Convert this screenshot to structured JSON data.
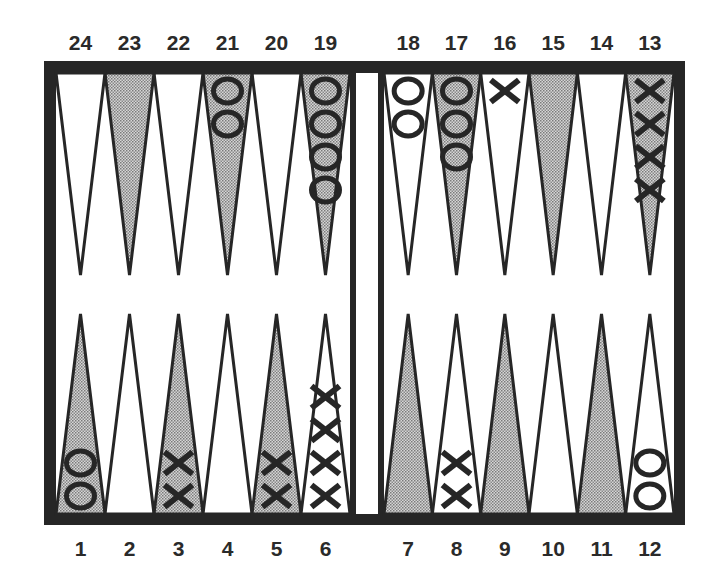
{
  "board": {
    "frame_color": "#262626",
    "shaded_fill": "#b8b8b8",
    "light_fill": "#ffffff",
    "background": "#ffffff"
  },
  "labels": {
    "top": [
      "24",
      "23",
      "22",
      "21",
      "20",
      "19",
      "18",
      "17",
      "16",
      "15",
      "14",
      "13"
    ],
    "bottom": [
      "1",
      "2",
      "3",
      "4",
      "5",
      "6",
      "7",
      "8",
      "9",
      "10",
      "11",
      "12"
    ]
  },
  "points": [
    {
      "number": 1,
      "shaded": true,
      "checkers": {
        "type": "O",
        "count": 2
      }
    },
    {
      "number": 2,
      "shaded": false,
      "checkers": {
        "type": "",
        "count": 0
      }
    },
    {
      "number": 3,
      "shaded": true,
      "checkers": {
        "type": "X",
        "count": 2
      }
    },
    {
      "number": 4,
      "shaded": false,
      "checkers": {
        "type": "",
        "count": 0
      }
    },
    {
      "number": 5,
      "shaded": true,
      "checkers": {
        "type": "X",
        "count": 2
      }
    },
    {
      "number": 6,
      "shaded": false,
      "checkers": {
        "type": "X",
        "count": 4
      }
    },
    {
      "number": 7,
      "shaded": true,
      "checkers": {
        "type": "",
        "count": 0
      }
    },
    {
      "number": 8,
      "shaded": false,
      "checkers": {
        "type": "X",
        "count": 2
      }
    },
    {
      "number": 9,
      "shaded": true,
      "checkers": {
        "type": "",
        "count": 0
      }
    },
    {
      "number": 10,
      "shaded": false,
      "checkers": {
        "type": "",
        "count": 0
      }
    },
    {
      "number": 11,
      "shaded": true,
      "checkers": {
        "type": "",
        "count": 0
      }
    },
    {
      "number": 12,
      "shaded": false,
      "checkers": {
        "type": "O",
        "count": 2
      }
    },
    {
      "number": 13,
      "shaded": true,
      "checkers": {
        "type": "X",
        "count": 4
      }
    },
    {
      "number": 14,
      "shaded": false,
      "checkers": {
        "type": "",
        "count": 0
      }
    },
    {
      "number": 15,
      "shaded": true,
      "checkers": {
        "type": "",
        "count": 0
      }
    },
    {
      "number": 16,
      "shaded": false,
      "checkers": {
        "type": "X",
        "count": 1
      }
    },
    {
      "number": 17,
      "shaded": true,
      "checkers": {
        "type": "O",
        "count": 3
      }
    },
    {
      "number": 18,
      "shaded": false,
      "checkers": {
        "type": "O",
        "count": 2
      }
    },
    {
      "number": 19,
      "shaded": true,
      "checkers": {
        "type": "O",
        "count": 4
      }
    },
    {
      "number": 20,
      "shaded": false,
      "checkers": {
        "type": "",
        "count": 0
      }
    },
    {
      "number": 21,
      "shaded": true,
      "checkers": {
        "type": "O",
        "count": 2
      }
    },
    {
      "number": 22,
      "shaded": false,
      "checkers": {
        "type": "",
        "count": 0
      }
    },
    {
      "number": 23,
      "shaded": true,
      "checkers": {
        "type": "",
        "count": 0
      }
    },
    {
      "number": 24,
      "shaded": false,
      "checkers": {
        "type": "",
        "count": 0
      }
    }
  ],
  "bar": {
    "checkers": 0
  }
}
